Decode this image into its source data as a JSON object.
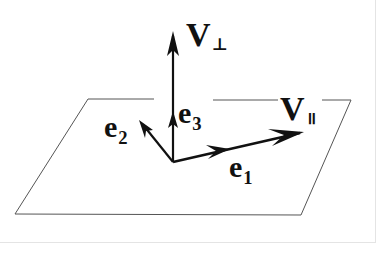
{
  "diagram": {
    "colors": {
      "background": "#ffffff",
      "ink": "#111111",
      "plane_edge": "#555555",
      "frame_border": "#e4e4e4"
    },
    "plane": {
      "shape": "parallelogram",
      "corners": [
        [
          88,
          99
        ],
        [
          351,
          100
        ],
        [
          301,
          215
        ],
        [
          15,
          214
        ]
      ]
    },
    "origin": [
      173,
      162
    ],
    "vectors": [
      {
        "id": "V_perp",
        "from": [
          173,
          162
        ],
        "to": [
          173,
          32
        ],
        "label": "V",
        "subscript": "⊥"
      },
      {
        "id": "e3",
        "from": [
          173,
          162
        ],
        "to": [
          173,
          112
        ],
        "label": "e",
        "subscript": "3"
      },
      {
        "id": "e2",
        "from": [
          173,
          162
        ],
        "to": [
          141,
          122
        ],
        "label": "e",
        "subscript": "2"
      },
      {
        "id": "e1",
        "from": [
          173,
          162
        ],
        "to": [
          228,
          149
        ],
        "label": "e",
        "subscript": "1"
      },
      {
        "id": "V_par",
        "from": [
          173,
          162
        ],
        "to": [
          303,
          132
        ],
        "label": "V",
        "subscript": "∥"
      }
    ]
  },
  "labels": {
    "v_perp": {
      "main": "V",
      "sub": "⊥"
    },
    "v_par": {
      "main": "V",
      "sub": "॥"
    },
    "e3": {
      "main": "e",
      "sub": "3"
    },
    "e2": {
      "main": "e",
      "sub": "2"
    },
    "e1": {
      "main": "e",
      "sub": "1"
    }
  }
}
